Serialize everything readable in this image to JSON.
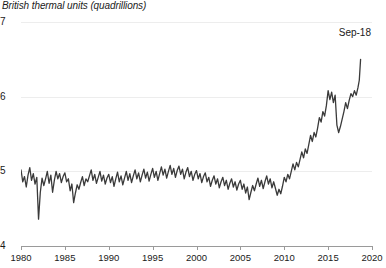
{
  "chart_data": {
    "type": "line",
    "title": "British thermal units (quadrillions)",
    "xlabel": "",
    "ylabel": "",
    "xlim": [
      1980,
      2020
    ],
    "ylim": [
      4,
      7
    ],
    "grid": true,
    "legend": false,
    "y_ticks": [
      "7",
      "6",
      "5",
      "4"
    ],
    "y_tick_values": [
      7,
      6,
      5,
      4
    ],
    "x_ticks": [
      "1980",
      "1985",
      "1990",
      "1995",
      "2000",
      "2005",
      "2010",
      "2015",
      "2020"
    ],
    "x_tick_values": [
      1980,
      1985,
      1990,
      1995,
      2000,
      2005,
      2010,
      2015,
      2020
    ],
    "annotations": [
      {
        "text": "Sep-18",
        "x": 2018.7,
        "y": 6.5
      }
    ],
    "line_color": "#3a3a3a",
    "grid_color": "#ededed",
    "axis_color": "#9a9a9a",
    "series": [
      {
        "name": "British thermal units (quadrillions)",
        "x": [
          1980.0,
          1980.2,
          1980.4,
          1980.6,
          1980.8,
          1981.0,
          1981.2,
          1981.4,
          1981.6,
          1981.8,
          1982.0,
          1982.2,
          1982.4,
          1982.6,
          1982.8,
          1983.0,
          1983.2,
          1983.4,
          1983.6,
          1983.8,
          1984.0,
          1984.2,
          1984.4,
          1984.6,
          1984.8,
          1985.0,
          1985.2,
          1985.4,
          1985.6,
          1985.8,
          1986.0,
          1986.2,
          1986.4,
          1986.6,
          1986.8,
          1987.0,
          1987.2,
          1987.4,
          1987.6,
          1987.8,
          1988.0,
          1988.2,
          1988.4,
          1988.6,
          1988.8,
          1989.0,
          1989.2,
          1989.4,
          1989.6,
          1989.8,
          1990.0,
          1990.2,
          1990.4,
          1990.6,
          1990.8,
          1991.0,
          1991.2,
          1991.4,
          1991.6,
          1991.8,
          1992.0,
          1992.2,
          1992.4,
          1992.6,
          1992.8,
          1993.0,
          1993.2,
          1993.4,
          1993.6,
          1993.8,
          1994.0,
          1994.2,
          1994.4,
          1994.6,
          1994.8,
          1995.0,
          1995.2,
          1995.4,
          1995.6,
          1995.8,
          1996.0,
          1996.2,
          1996.4,
          1996.6,
          1996.8,
          1997.0,
          1997.2,
          1997.4,
          1997.6,
          1997.8,
          1998.0,
          1998.2,
          1998.4,
          1998.6,
          1998.8,
          1999.0,
          1999.2,
          1999.4,
          1999.6,
          1999.8,
          2000.0,
          2000.2,
          2000.4,
          2000.6,
          2000.8,
          2001.0,
          2001.2,
          2001.4,
          2001.6,
          2001.8,
          2002.0,
          2002.2,
          2002.4,
          2002.6,
          2002.8,
          2003.0,
          2003.2,
          2003.4,
          2003.6,
          2003.8,
          2004.0,
          2004.2,
          2004.4,
          2004.6,
          2004.8,
          2005.0,
          2005.2,
          2005.4,
          2005.6,
          2005.8,
          2006.0,
          2006.2,
          2006.4,
          2006.6,
          2006.8,
          2007.0,
          2007.2,
          2007.4,
          2007.6,
          2007.8,
          2008.0,
          2008.2,
          2008.4,
          2008.6,
          2008.8,
          2009.0,
          2009.2,
          2009.4,
          2009.6,
          2009.8,
          2010.0,
          2010.2,
          2010.4,
          2010.6,
          2010.8,
          2011.0,
          2011.2,
          2011.4,
          2011.6,
          2011.8,
          2012.0,
          2012.2,
          2012.4,
          2012.6,
          2012.8,
          2013.0,
          2013.2,
          2013.4,
          2013.6,
          2013.8,
          2014.0,
          2014.2,
          2014.4,
          2014.6,
          2014.8,
          2015.0,
          2015.2,
          2015.4,
          2015.6,
          2015.8,
          2016.0,
          2016.2,
          2016.4,
          2016.6,
          2016.8,
          2017.0,
          2017.2,
          2017.4,
          2017.6,
          2017.8,
          2018.0,
          2018.2,
          2018.4,
          2018.55,
          2018.7
        ],
        "values": [
          5.02,
          4.86,
          4.93,
          4.79,
          4.95,
          5.05,
          4.88,
          4.97,
          4.83,
          4.92,
          4.36,
          4.72,
          4.91,
          4.81,
          4.9,
          5.0,
          4.84,
          4.95,
          4.72,
          4.88,
          5.0,
          4.9,
          4.97,
          4.85,
          4.93,
          4.98,
          4.86,
          4.9,
          4.74,
          4.83,
          4.58,
          4.71,
          4.82,
          4.76,
          4.85,
          4.93,
          4.81,
          4.9,
          4.86,
          4.94,
          5.02,
          4.88,
          4.96,
          4.84,
          4.92,
          5.0,
          4.87,
          4.95,
          4.83,
          4.91,
          4.96,
          4.85,
          4.93,
          4.8,
          4.9,
          4.99,
          4.86,
          4.94,
          4.82,
          4.91,
          5.0,
          4.88,
          4.97,
          4.85,
          4.94,
          5.02,
          4.9,
          4.98,
          4.86,
          4.95,
          5.03,
          4.91,
          4.99,
          4.87,
          4.96,
          5.04,
          4.92,
          5.0,
          4.88,
          4.97,
          5.06,
          4.95,
          5.03,
          4.91,
          5.0,
          5.08,
          4.96,
          5.04,
          4.92,
          5.01,
          5.07,
          4.96,
          5.03,
          4.9,
          4.99,
          5.05,
          4.93,
          5.0,
          4.88,
          4.96,
          5.01,
          4.9,
          4.97,
          4.85,
          4.93,
          4.98,
          4.86,
          4.92,
          4.8,
          4.88,
          4.94,
          4.83,
          4.9,
          4.78,
          4.86,
          4.92,
          4.81,
          4.88,
          4.76,
          4.84,
          4.9,
          4.79,
          4.86,
          4.75,
          4.83,
          4.88,
          4.76,
          4.83,
          4.71,
          4.79,
          4.62,
          4.72,
          4.81,
          4.74,
          4.83,
          4.91,
          4.8,
          4.88,
          4.77,
          4.86,
          4.94,
          4.83,
          4.9,
          4.78,
          4.86,
          4.77,
          4.68,
          4.76,
          4.7,
          4.8,
          4.92,
          4.86,
          4.96,
          4.9,
          5.0,
          5.1,
          5.02,
          5.12,
          5.06,
          5.16,
          5.26,
          5.18,
          5.3,
          5.24,
          5.36,
          5.48,
          5.4,
          5.52,
          5.46,
          5.58,
          5.72,
          5.66,
          5.8,
          5.74,
          5.88,
          6.08,
          5.96,
          6.06,
          5.92,
          6.02,
          5.62,
          5.52,
          5.6,
          5.7,
          5.8,
          5.92,
          5.84,
          5.95,
          6.04,
          6.0,
          6.08,
          6.02,
          6.12,
          6.22,
          6.5
        ]
      }
    ]
  }
}
